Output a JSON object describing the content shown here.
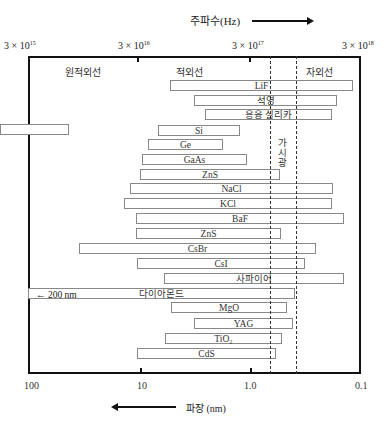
{
  "chart_data": {
    "type": "bar",
    "subtype": "range (floating horizontal bars)",
    "title": "",
    "top_axis": {
      "label": "주파수(Hz)",
      "ticks": [
        "3×10^15",
        "3×10^16",
        "3×10^17",
        "3×10^18"
      ]
    },
    "bottom_axis": {
      "label": "파장 (nm)",
      "ticks": [
        "100",
        "10",
        "1.0",
        "0.1"
      ],
      "scale": "log",
      "direction": "decreasing left-to-right"
    },
    "regions": [
      "원적외선",
      "적외선",
      "자외선"
    ],
    "visible_band_label": "가시광",
    "visible_band_nm": [
      0.7,
      0.4
    ],
    "series": [
      {
        "name": "LiF",
        "range_nm": [
          5.5,
          0.1
        ]
      },
      {
        "name": "석영",
        "range_nm": [
          3.5,
          0.15
        ]
      },
      {
        "name": "용융 실리카",
        "range_nm": [
          3.0,
          0.18
        ]
      },
      {
        "name": "",
        "range_nm": [
          200,
          50
        ]
      },
      {
        "name": "Si",
        "range_nm": [
          7,
          1.1
        ]
      },
      {
        "name": "Ge",
        "range_nm": [
          9,
          1.8
        ]
      },
      {
        "name": "GaAs",
        "range_nm": [
          10,
          1.0
        ]
      },
      {
        "name": "ZnS",
        "range_nm": [
          11,
          0.6
        ]
      },
      {
        "name": "NaCl",
        "range_nm": [
          14,
          0.2
        ]
      },
      {
        "name": "KCl",
        "range_nm": [
          16,
          0.2
        ]
      },
      {
        "name": "BaF",
        "range_nm": [
          12,
          0.15
        ]
      },
      {
        "name": "ZnS",
        "range_nm": [
          12,
          0.6
        ]
      },
      {
        "name": "CsBr",
        "range_nm": [
          35,
          0.3
        ]
      },
      {
        "name": "CsI",
        "range_nm": [
          12,
          0.35
        ]
      },
      {
        "name": "사파이어",
        "range_nm": [
          6.5,
          0.15
        ]
      },
      {
        "name": "다이아몬드",
        "range_nm": [
          200,
          0.4
        ]
      },
      {
        "name": "MgO",
        "range_nm": [
          6,
          0.45
        ]
      },
      {
        "name": "YAG",
        "range_nm": [
          3.5,
          0.4
        ]
      },
      {
        "name": "TiO2",
        "range_nm": [
          7,
          0.6
        ]
      },
      {
        "name": "CdS",
        "range_nm": [
          12,
          0.7
        ]
      }
    ],
    "annotations": [
      "← 200 nm"
    ]
  },
  "labels": {
    "freq_title": "주파수(Hz)",
    "wl_title": "파장 (nm)",
    "vis": "가시광",
    "dia_left": "← 200 nm",
    "region_far_ir": "원적외선",
    "region_ir": "적외선",
    "region_uv": "자외선",
    "top_ticks": [
      "3 × 10",
      "15",
      "3 × 10",
      "16",
      "3 × 10",
      "17",
      "3 × 10",
      "18"
    ],
    "bottom_ticks": [
      "100",
      "10",
      "1.0",
      "0.1"
    ]
  },
  "bars": [
    {
      "label": "LiF",
      "left": 170,
      "top": 80,
      "width": 183
    },
    {
      "label": "석영",
      "left": 194,
      "top": 95,
      "width": 143
    },
    {
      "label": "용융 실리카",
      "left": 205,
      "top": 109,
      "width": 127
    },
    {
      "label": "",
      "left": 0,
      "top": 124,
      "width": 69
    },
    {
      "label": "Si",
      "left": 158,
      "top": 125,
      "width": 82
    },
    {
      "label": "Ge",
      "left": 148,
      "top": 139,
      "width": 75
    },
    {
      "label": "GaAs",
      "left": 142,
      "top": 154,
      "width": 105
    },
    {
      "label": "ZnS",
      "left": 140,
      "top": 169,
      "width": 140
    },
    {
      "label": "NaCl",
      "left": 130,
      "top": 183,
      "width": 203
    },
    {
      "label": "KCl",
      "left": 124,
      "top": 198,
      "width": 208
    },
    {
      "label": "BaF",
      "left": 136,
      "top": 213,
      "width": 208
    },
    {
      "label": "ZnS",
      "left": 136,
      "top": 228,
      "width": 145
    },
    {
      "label": "CsBr",
      "left": 79,
      "top": 243,
      "width": 237
    },
    {
      "label": "CsI",
      "left": 137,
      "top": 258,
      "width": 168
    },
    {
      "label": "사파이어",
      "left": 164,
      "top": 273,
      "width": 180
    },
    {
      "label": "다이아몬드",
      "left": 28,
      "top": 288,
      "width": 267
    },
    {
      "label": "MgO",
      "left": 171,
      "top": 302,
      "width": 116
    },
    {
      "label": "YAG",
      "left": 194,
      "top": 318,
      "width": 99
    },
    {
      "label": "TiO₂",
      "left": 165,
      "top": 333,
      "width": 117
    },
    {
      "label": "CdS",
      "left": 137,
      "top": 348,
      "width": 139
    }
  ]
}
